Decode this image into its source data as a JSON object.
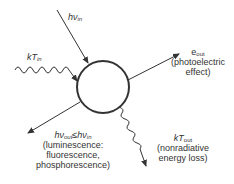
{
  "diagram": {
    "colors": {
      "stroke": "#333333",
      "background": "#ffffff"
    },
    "center": {
      "shape": "circle"
    },
    "inputs": [
      {
        "id": "photon_in",
        "symbol": "hν",
        "subscript": "in",
        "line": "straight-arrow-in"
      },
      {
        "id": "thermal_in",
        "symbol": "kT",
        "subscript": "in",
        "line": "wavy-arrow-in"
      }
    ],
    "outputs": [
      {
        "id": "electron_out",
        "symbol": "e",
        "subscript": "out",
        "description": "(photoelectric",
        "description2": "effect)"
      },
      {
        "id": "photon_out",
        "symbol": "hν",
        "subscript": "out",
        "relation": "≤",
        "symbol2": "hν",
        "subscript2": "in",
        "description": "(luminescence:",
        "description2": "fluorescence,",
        "description3": "phosphorescence)"
      },
      {
        "id": "thermal_out",
        "symbol": "kT",
        "subscript": "out",
        "description": "(nonradiative",
        "description2": "energy loss)"
      }
    ]
  }
}
